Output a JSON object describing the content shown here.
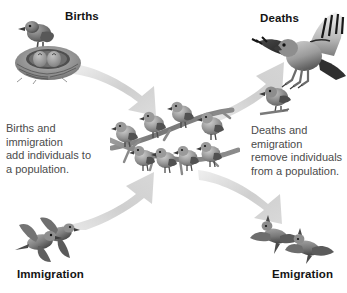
{
  "figure": {
    "background_color": "#ffffff",
    "label_color": "#141414",
    "body_text_color": "#4b4b4b",
    "arrow_color": "#c9c9c9"
  },
  "labels": {
    "births": "Births",
    "deaths": "Deaths",
    "immigration": "Immigration",
    "emigration": "Emigration"
  },
  "captions": {
    "left": "Births and\nimmigration\nadd individuals to\na population.",
    "right": "Deaths and\nemigration\nremove individuals\nfrom a population."
  },
  "illustrations": {
    "nest": "nest-with-parent-bird-and-chicks-icon",
    "hawk": "hawk-catching-prey-icon",
    "immigrating_birds": "two-flying-birds-icon",
    "emigrating_birds": "two-flying-birds-icon",
    "population": "eight-birds-on-branch-icon"
  },
  "arrows": {
    "births_in": "arrow-births-to-population",
    "immigration_in": "arrow-immigration-to-population",
    "deaths_out": "arrow-population-to-deaths",
    "emigration_out": "arrow-population-to-emigration"
  },
  "population": {
    "total_birds": 8,
    "upper_branch_birds": 4,
    "lower_branch_birds": 4
  }
}
